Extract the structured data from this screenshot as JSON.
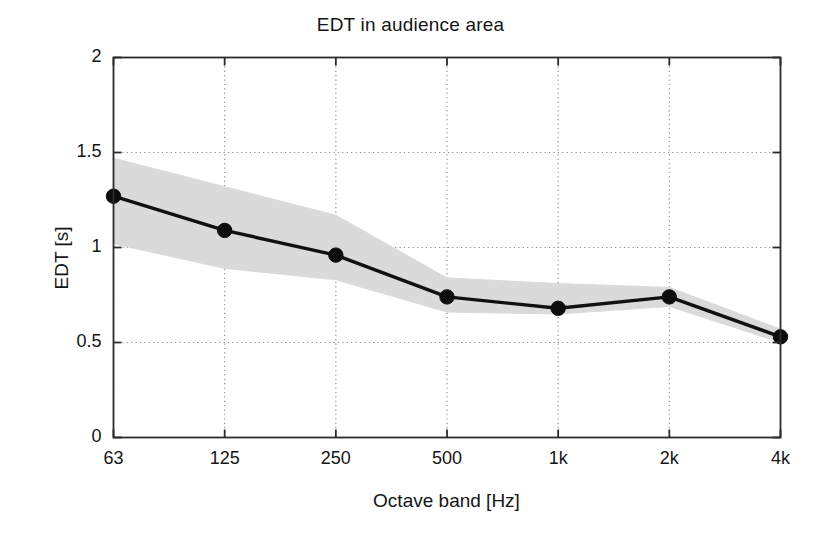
{
  "chart_data": {
    "type": "line",
    "title": "EDT in audience area",
    "xlabel": "Octave band [Hz]",
    "ylabel": "EDT [s]",
    "categories": [
      "63",
      "125",
      "250",
      "500",
      "1k",
      "2k",
      "4k"
    ],
    "values": [
      1.27,
      1.09,
      0.96,
      0.74,
      0.68,
      0.74,
      0.53
    ],
    "band_upper": [
      1.47,
      1.32,
      1.17,
      0.84,
      0.81,
      0.79,
      0.57
    ],
    "band_lower": [
      1.02,
      0.89,
      0.83,
      0.66,
      0.65,
      0.69,
      0.5
    ],
    "band_label": "standard deviation band",
    "ylim": [
      0,
      2
    ],
    "yticks": [
      "0",
      "0.5",
      "1",
      "1.5",
      "2"
    ],
    "ytick_values": [
      0,
      0.5,
      1,
      1.5,
      2
    ],
    "xticks": [
      "63",
      "125",
      "250",
      "500",
      "1k",
      "2k",
      "4k"
    ],
    "grid": "dotted",
    "legend": "none",
    "series_name": "EDT mean",
    "colors": {
      "line": "#111111",
      "marker": "#0d0d0d",
      "band": "#d9d9d9",
      "grid": "#8a8a8a",
      "axis": "#2b2b2b",
      "background": "#ffffff",
      "text": "#151515"
    }
  }
}
